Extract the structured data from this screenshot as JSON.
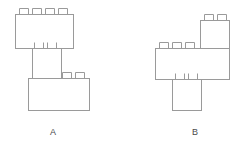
{
  "figure": {
    "background_color": "#ffffff",
    "stroke_color": "#9a9a9a",
    "stroke_width": 1,
    "fill_color": "#ffffff",
    "canvas": {
      "width": 243,
      "height": 153
    }
  },
  "labels": {
    "a": "A",
    "b": "B"
  },
  "structures": [
    {
      "id": "structure-a",
      "label": "A",
      "label_x": 50,
      "label_y": 127,
      "bricks": [
        {
          "name": "brick-a-top",
          "x": 15,
          "y": 14,
          "width": 58,
          "height": 34,
          "top_studs": [
            {
              "x": 19,
              "y": 8,
              "width": 9,
              "height": 6
            },
            {
              "x": 32,
              "y": 8,
              "width": 9,
              "height": 6
            },
            {
              "x": 45,
              "y": 8,
              "width": 9,
              "height": 6
            },
            {
              "x": 58,
              "y": 8,
              "width": 9,
              "height": 6
            }
          ],
          "bottom_studs": [
            {
              "x": 34,
              "y": 42,
              "width": 9,
              "height": 6
            },
            {
              "x": 47,
              "y": 42,
              "width": 9,
              "height": 6
            }
          ]
        },
        {
          "name": "brick-a-middle",
          "x": 32,
          "y": 48,
          "width": 29,
          "height": 30,
          "top_studs": [],
          "bottom_studs": []
        },
        {
          "name": "brick-a-bottom",
          "x": 28,
          "y": 78,
          "width": 61,
          "height": 32,
          "top_studs": [
            {
              "x": 62,
              "y": 72,
              "width": 9,
              "height": 6
            },
            {
              "x": 75,
              "y": 72,
              "width": 9,
              "height": 6
            }
          ],
          "bottom_studs": []
        }
      ]
    },
    {
      "id": "structure-b",
      "label": "B",
      "label_x": 192,
      "label_y": 127,
      "bricks": [
        {
          "name": "brick-b-top",
          "x": 200,
          "y": 20,
          "width": 29,
          "height": 28,
          "top_studs": [
            {
              "x": 204,
              "y": 14,
              "width": 9,
              "height": 6
            },
            {
              "x": 217,
              "y": 14,
              "width": 9,
              "height": 6
            }
          ],
          "bottom_studs": []
        },
        {
          "name": "brick-b-middle",
          "x": 155,
          "y": 48,
          "width": 74,
          "height": 31,
          "top_studs": [
            {
              "x": 159,
              "y": 42,
              "width": 9,
              "height": 6
            },
            {
              "x": 172,
              "y": 42,
              "width": 9,
              "height": 6
            },
            {
              "x": 185,
              "y": 42,
              "width": 9,
              "height": 6
            }
          ],
          "bottom_studs": [
            {
              "x": 175,
              "y": 73,
              "width": 9,
              "height": 6
            },
            {
              "x": 188,
              "y": 73,
              "width": 9,
              "height": 6
            }
          ]
        },
        {
          "name": "brick-b-bottom",
          "x": 172,
          "y": 79,
          "width": 29,
          "height": 31,
          "top_studs": [],
          "bottom_studs": []
        }
      ]
    }
  ]
}
